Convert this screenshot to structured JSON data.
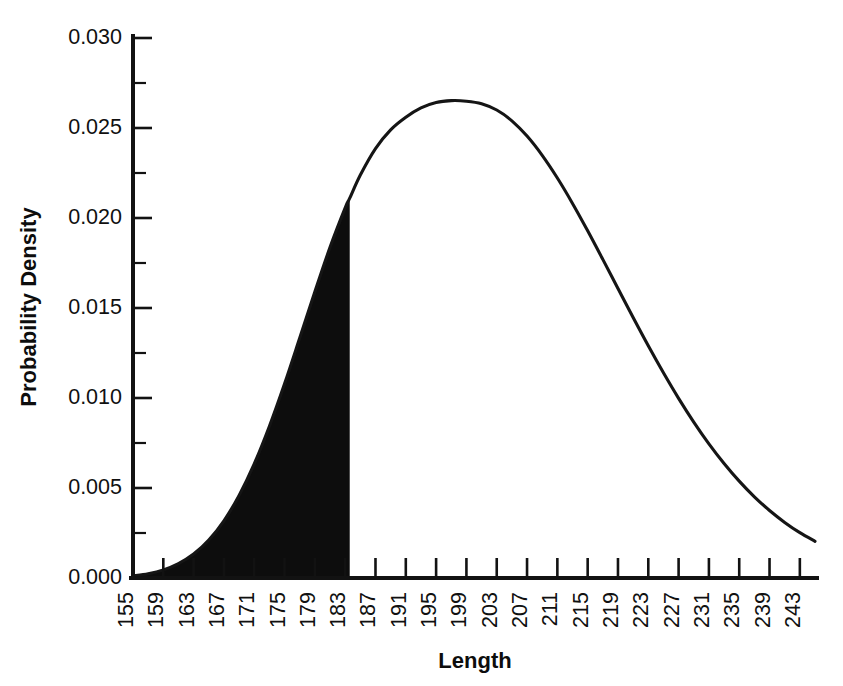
{
  "chart_data": {
    "type": "area",
    "title": "",
    "xlabel": "Length",
    "ylabel": "Probability Density",
    "xlim": [
      155,
      245
    ],
    "ylim": [
      0.0,
      0.03
    ],
    "grid": false,
    "legend": "none",
    "x_tick_labels": [
      "155",
      "159",
      "163",
      "167",
      "171",
      "175",
      "179",
      "183",
      "187",
      "191",
      "195",
      "199",
      "203",
      "207",
      "211",
      "215",
      "219",
      "223",
      "227",
      "231",
      "235",
      "239",
      "243"
    ],
    "x_tick_values": [
      155,
      159,
      163,
      167,
      171,
      175,
      179,
      183,
      187,
      191,
      195,
      199,
      203,
      207,
      211,
      215,
      219,
      223,
      227,
      231,
      235,
      239,
      243
    ],
    "y_tick_labels": [
      "0.000",
      "0.005",
      "0.010",
      "0.015",
      "0.020",
      "0.025",
      "0.030"
    ],
    "y_tick_values": [
      0.0,
      0.005,
      0.01,
      0.015,
      0.02,
      0.025,
      0.03
    ],
    "y_minor_tick_values": [
      0.0025,
      0.0075,
      0.0125,
      0.0175,
      0.0225,
      0.0275
    ],
    "curve_description": "Right-skewed unimodal probability density curve",
    "peak_x": 198.5,
    "peak_y": 0.0265,
    "shaded_region": {
      "from_x": 155,
      "to_x": 183.6,
      "boundary_y": 0.0159,
      "fill_color": "#0d0d0d",
      "description": "Solid black filled area under the curve from the left tail to x = 183.6"
    },
    "series": [
      {
        "name": "Probability Density",
        "color": "#151515",
        "x": [
          155,
          157,
          159,
          161,
          163,
          165,
          167,
          169,
          171,
          173,
          175,
          177,
          179,
          181,
          183,
          183.6,
          185,
          187,
          189,
          191,
          193,
          195,
          197,
          199,
          201,
          203,
          205,
          207,
          209,
          211,
          213,
          215,
          217,
          219,
          221,
          223,
          225,
          227,
          229,
          231,
          233,
          235,
          237,
          239,
          241,
          243,
          245
        ],
        "y": [
          0.00012,
          0.00024,
          0.00045,
          0.0008,
          0.00133,
          0.00211,
          0.00318,
          0.00459,
          0.00634,
          0.00843,
          0.01079,
          0.01333,
          0.0159,
          0.01837,
          0.02056,
          0.0211,
          0.02239,
          0.02386,
          0.0249,
          0.0256,
          0.02612,
          0.02642,
          0.02652,
          0.02649,
          0.02635,
          0.026,
          0.0254,
          0.02455,
          0.02348,
          0.02222,
          0.02081,
          0.01929,
          0.0177,
          0.01608,
          0.01447,
          0.0129,
          0.0114,
          0.00998,
          0.00866,
          0.00745,
          0.00636,
          0.00538,
          0.00451,
          0.00375,
          0.00309,
          0.00252,
          0.00204
        ]
      }
    ]
  },
  "axes": {
    "y_axis_title": "Probability Density",
    "x_axis_title": "Length"
  }
}
